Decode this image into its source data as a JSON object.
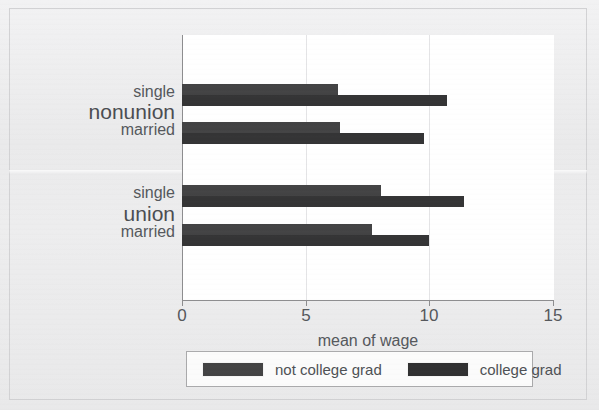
{
  "chart_data": {
    "type": "bar",
    "orientation": "horizontal",
    "title": "",
    "xlabel": "mean of wage",
    "ylabel": "",
    "xlim": [
      0,
      15
    ],
    "xticks": [
      0,
      5,
      10,
      15
    ],
    "xtick_labels": [
      "0",
      "5",
      "10",
      "15"
    ],
    "grid": false,
    "legend_position": "bottom",
    "groups": [
      {
        "label": "nonunion",
        "categories": [
          "single",
          "married"
        ]
      },
      {
        "label": "union",
        "categories": [
          "single",
          "married"
        ]
      }
    ],
    "series": [
      {
        "name": "not college grad",
        "color": "#434344",
        "values": [
          6.3,
          6.4,
          8.05,
          7.7
        ]
      },
      {
        "name": "college grad",
        "color": "#303031",
        "values": [
          10.7,
          9.8,
          11.4,
          10.0
        ]
      }
    ],
    "points": [
      {
        "group": "nonunion",
        "category": "single",
        "series": "not college grad",
        "value": 6.3
      },
      {
        "group": "nonunion",
        "category": "single",
        "series": "college grad",
        "value": 10.7
      },
      {
        "group": "nonunion",
        "category": "married",
        "series": "not college grad",
        "value": 6.4
      },
      {
        "group": "nonunion",
        "category": "married",
        "series": "college grad",
        "value": 9.8
      },
      {
        "group": "union",
        "category": "single",
        "series": "not college grad",
        "value": 8.05
      },
      {
        "group": "union",
        "category": "single",
        "series": "college grad",
        "value": 11.4
      },
      {
        "group": "union",
        "category": "married",
        "series": "not college grad",
        "value": 7.7
      },
      {
        "group": "union",
        "category": "married",
        "series": "college grad",
        "value": 10.0
      }
    ]
  },
  "axis": {
    "x_title": "mean of wage",
    "tick_0": "0",
    "tick_5": "5",
    "tick_10": "10",
    "tick_15": "15"
  },
  "categories": {
    "nonunion_label": "nonunion",
    "union_label": "union",
    "nonunion_single": "single",
    "nonunion_married": "married",
    "union_single": "single",
    "union_married": "married"
  },
  "legend": {
    "entry_1": "not college grad",
    "entry_2": "college grad"
  },
  "colors": {
    "bar_not_college_grad": "#434344",
    "bar_college_grad": "#303031",
    "plot_background": "#ffffff",
    "page_background": "#ececed",
    "axis_line": "#8d8d8f",
    "text": "#55585c"
  }
}
